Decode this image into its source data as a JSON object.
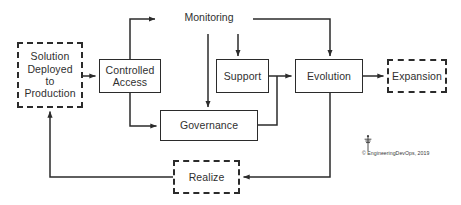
{
  "diagram": {
    "stroke_color": "#2b2b2b",
    "background": "#ffffff",
    "labels": {
      "monitoring": "Monitoring"
    },
    "nodes": [
      {
        "id": "solution",
        "label": "Solution\nDeployed\nto\nProduction",
        "style": "dashed"
      },
      {
        "id": "controlled",
        "label": "Controlled\nAccess",
        "style": "solid"
      },
      {
        "id": "support",
        "label": "Support",
        "style": "solid"
      },
      {
        "id": "evolution",
        "label": "Evolution",
        "style": "solid"
      },
      {
        "id": "expansion",
        "label": "Expansion",
        "style": "dashed"
      },
      {
        "id": "governance",
        "label": "Governance",
        "style": "solid"
      },
      {
        "id": "realize",
        "label": "Realize",
        "style": "dashed"
      }
    ],
    "credit": {
      "text": "© EngineeringDevOps, 2019",
      "mark": "engineeringdevops-logo"
    }
  }
}
